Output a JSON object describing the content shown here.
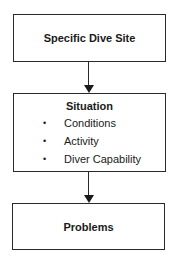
{
  "diagram": {
    "type": "flowchart",
    "nodes": [
      {
        "id": "specific-dive-site",
        "title": "Specific Dive Site"
      },
      {
        "id": "situation",
        "title": "Situation",
        "items": [
          "Conditions",
          "Activity",
          "Diver Capability"
        ],
        "bullet": "•"
      },
      {
        "id": "problems",
        "title": "Problems"
      }
    ],
    "edges": [
      {
        "from": "specific-dive-site",
        "to": "situation"
      },
      {
        "from": "situation",
        "to": "problems"
      }
    ]
  }
}
